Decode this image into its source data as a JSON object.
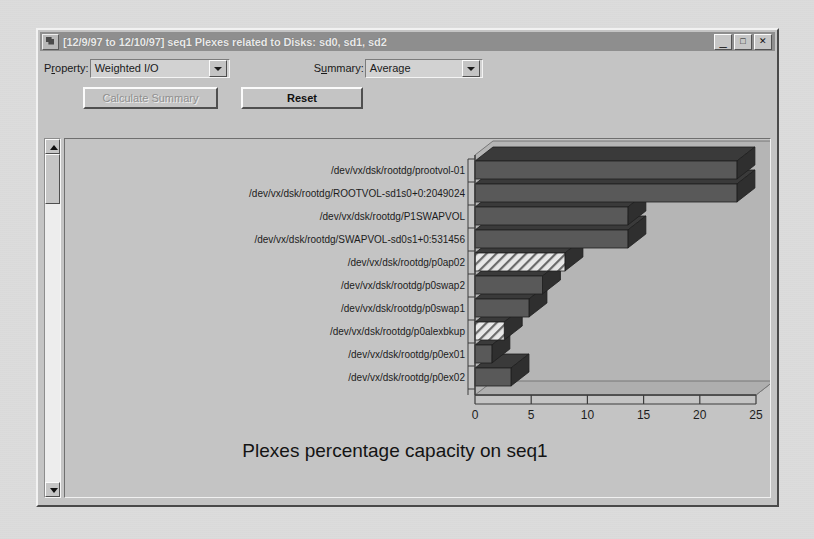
{
  "window": {
    "title": "[12/9/97 to 12/10/97] seq1 Plexes related to Disks: sd0, sd1, sd2",
    "icon": "app-icon",
    "buttons": {
      "minimize": "_",
      "maximize": "□",
      "close": "✕"
    }
  },
  "toolbar": {
    "property_label_pre": "P",
    "property_label_key": "r",
    "property_label_post": "operty:",
    "property_label": "Property:",
    "property_value": "Weighted I/O",
    "summary_label_pre": "S",
    "summary_label_key": "u",
    "summary_label_post": "mmary:",
    "summary_label": "Summary:",
    "summary_value": "Average",
    "calculate_summary_label": "Calculate Summary",
    "reset_label": "Reset",
    "dropdown_icon": "chevron-down-icon"
  },
  "scrollbar": {
    "up_icon": "scroll-up-arrow-icon",
    "down_icon": "scroll-down-arrow-icon"
  },
  "chart_data": {
    "type": "bar",
    "orientation": "horizontal",
    "title": "Plexes percentage capacity on seq1",
    "xlabel": "",
    "ylabel": "",
    "xlim": [
      0,
      25
    ],
    "xticks": [
      0,
      5,
      10,
      15,
      20,
      25
    ],
    "grid": false,
    "legend": false,
    "three_d": true,
    "categories": [
      "/dev/vx/dsk/rootdg/prootvol-01",
      "/dev/vx/dsk/rootdg/ROOTVOL-sd1s0+0:2049024",
      "/dev/vx/dsk/rootdg/P1SWAPVOL",
      "/dev/vx/dsk/rootdg/SWAPVOL-sd0s1+0:531456",
      "/dev/vx/dsk/rootdg/p0ap02",
      "/dev/vx/dsk/rootdg/p0swap2",
      "/dev/vx/dsk/rootdg/p0swap1",
      "/dev/vx/dsk/rootdg/p0alexbkup",
      "/dev/vx/dsk/rootdg/p0ex01",
      "/dev/vx/dsk/rootdg/p0ex02"
    ],
    "values": [
      23.3,
      23.3,
      13.6,
      13.6,
      8.0,
      6.0,
      4.8,
      2.6,
      1.5,
      3.2
    ],
    "bar_fills": [
      "solid",
      "solid",
      "solid",
      "solid",
      "hatched",
      "solid",
      "solid",
      "hatched",
      "solid",
      "solid"
    ],
    "colors": {
      "bar_face": "#595959",
      "bar_top": "#3a3a3a",
      "bar_side": "#2f2f2f",
      "bar_hatch_bg": "#e8e8e8",
      "bar_hatch_line": "#6a6a6a",
      "plot_back": "#b5b5b5",
      "panel": "#c4c4c4",
      "axis": "#3c3c3c"
    }
  }
}
